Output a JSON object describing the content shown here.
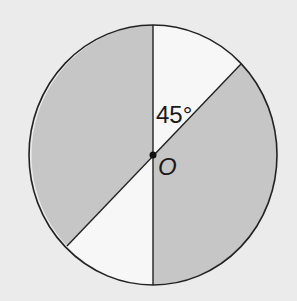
{
  "diagram": {
    "type": "circle-sectors",
    "center_label": "O",
    "angle_label": "45°",
    "angle_degrees": 45,
    "colors": {
      "background": "#ebebeb",
      "shaded": "#c6c6c6",
      "unshaded": "#f7f7f7",
      "stroke": "#222222"
    },
    "regions": [
      {
        "name": "upper-left",
        "shaded": true
      },
      {
        "name": "upper-right-wedge",
        "shaded": false
      },
      {
        "name": "right",
        "shaded": true
      },
      {
        "name": "lower-left-wedge",
        "shaded": false
      }
    ]
  }
}
